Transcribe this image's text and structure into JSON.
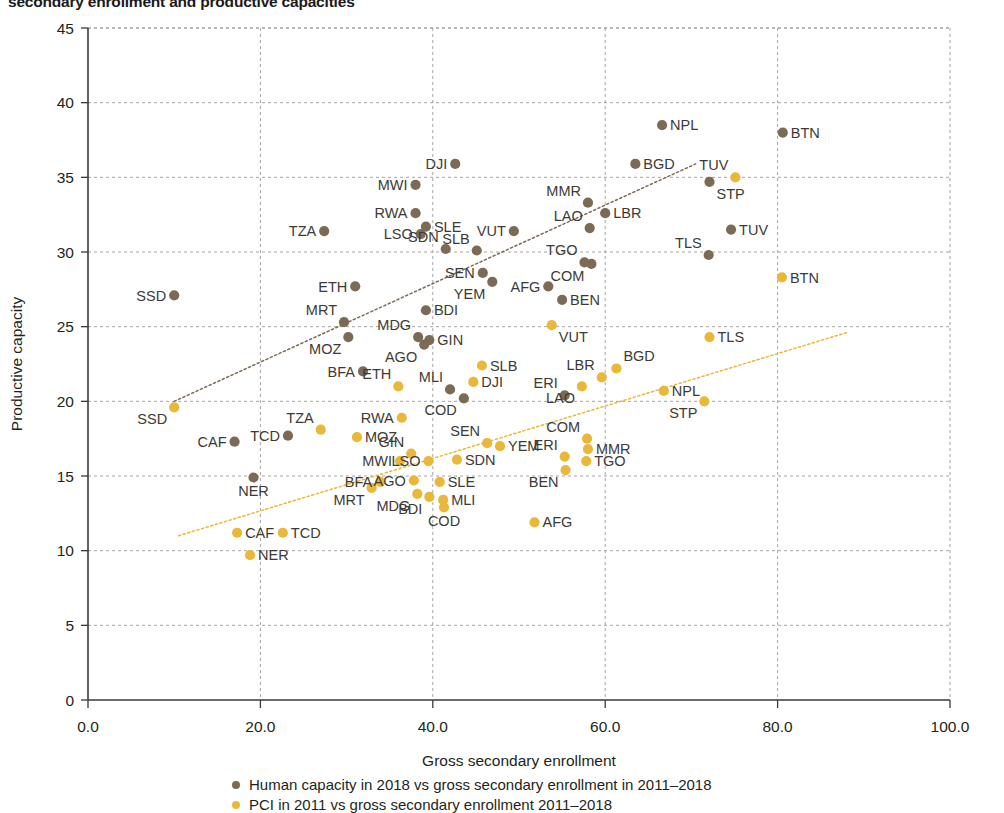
{
  "title": "secondary enrollment and productive capacities",
  "legend": {
    "items": [
      {
        "label": "Human capacity in 2018 vs gross secondary enrollment in 2011–2018",
        "color": "#7b6a55"
      },
      {
        "label": "PCI in 2011 vs gross secondary enrollment 2011–2018",
        "color": "#e9b83a"
      }
    ]
  },
  "chart_data": {
    "type": "scatter",
    "title": "secondary enrollment and productive capacities",
    "xlabel": "Gross secondary enrollment",
    "ylabel": "Productive capacity",
    "xlim": [
      0,
      100
    ],
    "ylim": [
      0,
      45
    ],
    "xticks": [
      "0.0",
      "20.0",
      "40.0",
      "60.0",
      "80.0",
      "100.0"
    ],
    "yticks": [
      "0",
      "5",
      "10",
      "15",
      "20",
      "25",
      "30",
      "35",
      "40",
      "45"
    ],
    "grid": true,
    "legend_position": "bottom",
    "series": [
      {
        "name": "Human capacity in 2018 vs gross secondary enrollment in 2011–2018",
        "color": "#7b6a55",
        "points": [
          {
            "label": "SSD",
            "x": 10.0,
            "y": 27.1,
            "lp": "left"
          },
          {
            "label": "CAF",
            "x": 17.0,
            "y": 17.3,
            "lp": "left"
          },
          {
            "label": "NER",
            "x": 19.2,
            "y": 14.9,
            "lp": "below"
          },
          {
            "label": "TCD",
            "x": 23.2,
            "y": 17.7,
            "lp": "left"
          },
          {
            "label": "TZA",
            "x": 27.4,
            "y": 31.4,
            "lp": "left"
          },
          {
            "label": "MRT",
            "x": 29.7,
            "y": 25.3,
            "lp": "above-left"
          },
          {
            "label": "MOZ",
            "x": 30.2,
            "y": 24.3,
            "lp": "below-left"
          },
          {
            "label": "ETH",
            "x": 31.0,
            "y": 27.7,
            "lp": "left"
          },
          {
            "label": "BFA",
            "x": 31.9,
            "y": 22.0,
            "lp": "left"
          },
          {
            "label": "MWI",
            "x": 38.0,
            "y": 34.5,
            "lp": "left"
          },
          {
            "label": "RWA",
            "x": 38.0,
            "y": 32.6,
            "lp": "left"
          },
          {
            "label": "LSO",
            "x": 38.6,
            "y": 31.2,
            "lp": "left"
          },
          {
            "label": "SLE",
            "x": 39.2,
            "y": 31.7,
            "lp": "right"
          },
          {
            "label": "MDG",
            "x": 38.3,
            "y": 24.3,
            "lp": "above-left"
          },
          {
            "label": "AGO",
            "x": 39.0,
            "y": 23.8,
            "lp": "below-left"
          },
          {
            "label": "GIN",
            "x": 39.6,
            "y": 24.1,
            "lp": "right"
          },
          {
            "label": "BDI",
            "x": 39.2,
            "y": 26.1,
            "lp": "right"
          },
          {
            "label": "DJI",
            "x": 42.6,
            "y": 35.9,
            "lp": "left"
          },
          {
            "label": "SDN",
            "x": 41.5,
            "y": 30.2,
            "lp": "above-left"
          },
          {
            "label": "MLI",
            "x": 42.0,
            "y": 20.8,
            "lp": "above-left"
          },
          {
            "label": "COD",
            "x": 43.6,
            "y": 20.2,
            "lp": "below-left"
          },
          {
            "label": "SLB",
            "x": 45.1,
            "y": 30.1,
            "lp": "above-left"
          },
          {
            "label": "SEN",
            "x": 45.8,
            "y": 28.6,
            "lp": "left"
          },
          {
            "label": "YEM",
            "x": 46.9,
            "y": 28.0,
            "lp": "below-left"
          },
          {
            "label": "VUT",
            "x": 49.4,
            "y": 31.4,
            "lp": "left"
          },
          {
            "label": "AFG",
            "x": 53.4,
            "y": 27.7,
            "lp": "left"
          },
          {
            "label": "BEN",
            "x": 55.0,
            "y": 26.8,
            "lp": "right"
          },
          {
            "label": "ERI",
            "x": 55.3,
            "y": 20.4,
            "lp": "above-left"
          },
          {
            "label": "LAO",
            "x": 58.2,
            "y": 31.6,
            "lp": "above-left"
          },
          {
            "label": "COM",
            "x": 58.4,
            "y": 29.2,
            "lp": "below-left"
          },
          {
            "label": "TGO",
            "x": 57.6,
            "y": 29.3,
            "lp": "above-left"
          },
          {
            "label": "MMR",
            "x": 58.0,
            "y": 33.3,
            "lp": "above-left"
          },
          {
            "label": "LBR",
            "x": 60.0,
            "y": 32.6,
            "lp": "right"
          },
          {
            "label": "BGD",
            "x": 63.5,
            "y": 35.9,
            "lp": "right"
          },
          {
            "label": "NPL",
            "x": 66.6,
            "y": 38.5,
            "lp": "right"
          },
          {
            "label": "TLS",
            "x": 72.0,
            "y": 29.8,
            "lp": "above-left"
          },
          {
            "label": "STP",
            "x": 72.1,
            "y": 34.7,
            "lp": "below-right"
          },
          {
            "label": "TUV",
            "x": 74.6,
            "y": 31.5,
            "lp": "right"
          },
          {
            "label": "BTN",
            "x": 80.6,
            "y": 38.0,
            "lp": "right"
          }
        ],
        "trend": {
          "x0": 10.0,
          "y0": 20.0,
          "x1": 70.5,
          "y1": 35.9
        }
      },
      {
        "name": "PCI in 2011 vs gross secondary enrollment 2011–2018",
        "color": "#e9b83a",
        "points": [
          {
            "label": "SSD",
            "x": 10.0,
            "y": 19.6,
            "lp": "below-left"
          },
          {
            "label": "NER",
            "x": 18.8,
            "y": 9.7,
            "lp": "right"
          },
          {
            "label": "CAF",
            "x": 17.3,
            "y": 11.2,
            "lp": "right"
          },
          {
            "label": "TCD",
            "x": 22.6,
            "y": 11.2,
            "lp": "right"
          },
          {
            "label": "TZA",
            "x": 27.0,
            "y": 18.1,
            "lp": "above-left"
          },
          {
            "label": "MOZ",
            "x": 31.2,
            "y": 17.6,
            "lp": "right"
          },
          {
            "label": "MRT",
            "x": 32.9,
            "y": 14.2,
            "lp": "below-left"
          },
          {
            "label": "BFA",
            "x": 33.9,
            "y": 14.6,
            "lp": "left"
          },
          {
            "label": "ETH",
            "x": 36.0,
            "y": 21.0,
            "lp": "above-left"
          },
          {
            "label": "MWI",
            "x": 36.2,
            "y": 16.0,
            "lp": "left"
          },
          {
            "label": "RWA",
            "x": 36.4,
            "y": 18.9,
            "lp": "left"
          },
          {
            "label": "GIN",
            "x": 37.5,
            "y": 16.5,
            "lp": "above-left"
          },
          {
            "label": "AGO",
            "x": 37.8,
            "y": 14.7,
            "lp": "left"
          },
          {
            "label": "MDG",
            "x": 38.2,
            "y": 13.8,
            "lp": "below-left"
          },
          {
            "label": "BDI",
            "x": 39.6,
            "y": 13.6,
            "lp": "below-left"
          },
          {
            "label": "LSO",
            "x": 39.5,
            "y": 16.0,
            "lp": "left"
          },
          {
            "label": "SLE",
            "x": 40.8,
            "y": 14.6,
            "lp": "right"
          },
          {
            "label": "MLI",
            "x": 41.2,
            "y": 13.4,
            "lp": "right"
          },
          {
            "label": "COD",
            "x": 41.3,
            "y": 12.9,
            "lp": "below"
          },
          {
            "label": "SDN",
            "x": 42.8,
            "y": 16.1,
            "lp": "right"
          },
          {
            "label": "DJI",
            "x": 44.7,
            "y": 21.3,
            "lp": "right"
          },
          {
            "label": "SLB",
            "x": 45.7,
            "y": 22.4,
            "lp": "right"
          },
          {
            "label": "SEN",
            "x": 46.3,
            "y": 17.2,
            "lp": "above-left"
          },
          {
            "label": "YEM",
            "x": 47.8,
            "y": 17.0,
            "lp": "right"
          },
          {
            "label": "AFG",
            "x": 51.8,
            "y": 11.9,
            "lp": "right"
          },
          {
            "label": "VUT",
            "x": 53.8,
            "y": 25.1,
            "lp": "below-right"
          },
          {
            "label": "ERI",
            "x": 55.3,
            "y": 16.3,
            "lp": "above-left"
          },
          {
            "label": "BEN",
            "x": 55.4,
            "y": 15.4,
            "lp": "below-left"
          },
          {
            "label": "COM",
            "x": 57.9,
            "y": 17.5,
            "lp": "above-left"
          },
          {
            "label": "MMR",
            "x": 58.0,
            "y": 16.8,
            "lp": "right"
          },
          {
            "label": "TGO",
            "x": 57.8,
            "y": 16.0,
            "lp": "right"
          },
          {
            "label": "LAO",
            "x": 57.3,
            "y": 21.0,
            "lp": "below-left"
          },
          {
            "label": "LBR",
            "x": 59.6,
            "y": 21.6,
            "lp": "above-left"
          },
          {
            "label": "BGD",
            "x": 61.3,
            "y": 22.2,
            "lp": "above-right"
          },
          {
            "label": "NPL",
            "x": 66.8,
            "y": 20.7,
            "lp": "right"
          },
          {
            "label": "STP",
            "x": 71.5,
            "y": 20.0,
            "lp": "below-left"
          },
          {
            "label": "TLS",
            "x": 72.1,
            "y": 24.3,
            "lp": "right"
          },
          {
            "label": "TUV",
            "x": 75.1,
            "y": 35.0,
            "lp": "above-left"
          },
          {
            "label": "BTN",
            "x": 80.5,
            "y": 28.3,
            "lp": "right"
          }
        ],
        "trend": {
          "x0": 10.5,
          "y0": 11.0,
          "x1": 88.0,
          "y1": 24.6
        }
      }
    ]
  }
}
